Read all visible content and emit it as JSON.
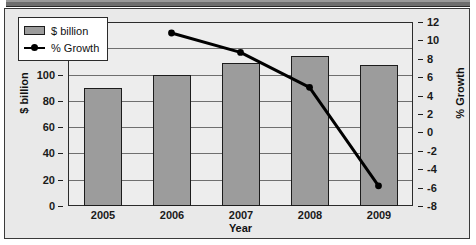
{
  "chart_data": {
    "type": "bar",
    "title": "",
    "xlabel": "Year",
    "ylabel": "$ billion",
    "y2label": "% Growth",
    "categories": [
      "2005",
      "2006",
      "2007",
      "2008",
      "2009"
    ],
    "grid": true,
    "legend_position": "top-left",
    "ylim": [
      0,
      140
    ],
    "yticks": [
      "0",
      "20",
      "40",
      "60",
      "80",
      "100",
      "120",
      "140"
    ],
    "y2lim": [
      -8,
      12
    ],
    "y2ticks": [
      "-8",
      "-6",
      "-4",
      "-2",
      "0",
      "2",
      "4",
      "6",
      "8",
      "10",
      "12"
    ],
    "series": [
      {
        "name": "$ billion",
        "type": "bar",
        "axis": "left",
        "color": "#9c9c9c",
        "values": [
          90,
          100,
          109,
          114,
          107
        ]
      },
      {
        "name": "% Growth",
        "type": "line",
        "axis": "right",
        "color": "#000000",
        "values": [
          null,
          10.8,
          8.7,
          4.9,
          -5.8
        ]
      }
    ]
  },
  "legend": {
    "items": [
      {
        "label": "$ billion",
        "swatch": "bar-swatch"
      },
      {
        "label": "% Growth",
        "swatch": "line-marker-swatch"
      }
    ]
  },
  "axes": {
    "left": {
      "label": "$ billion",
      "ticks": [
        "140",
        "120",
        "100",
        "80",
        "60",
        "40",
        "20",
        "0"
      ]
    },
    "right": {
      "label": "% Growth",
      "ticks": [
        "12",
        "10",
        "8",
        "6",
        "4",
        "2",
        "0",
        "-2",
        "-4",
        "-6",
        "-8"
      ]
    },
    "bottom": {
      "label": "Year",
      "ticks": [
        "2005",
        "2006",
        "2007",
        "2008",
        "2009"
      ]
    }
  },
  "colors": {
    "bar_fill": "#9c9c9c",
    "bar_outline": "#1c1c1c",
    "line": "#000000",
    "plot_bg": "#ededed",
    "frame_bg": "#e9e9e9",
    "gridline": "#6f6f6f"
  }
}
